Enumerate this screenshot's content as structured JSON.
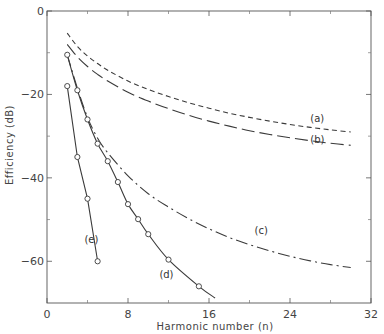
{
  "chart_data": {
    "type": "line",
    "title": "",
    "xlabel": "Harmonic number  (n)",
    "ylabel": "Efficiency (dB)",
    "xlim": [
      0,
      32
    ],
    "ylim": [
      -70,
      0
    ],
    "xticks": [
      0,
      8,
      16,
      24,
      32
    ],
    "xminor_ticks": [
      4,
      12,
      20,
      28
    ],
    "yticks": [
      0,
      -20,
      -40,
      -60
    ],
    "yminor_ticks": [
      -10,
      -30,
      -50
    ],
    "grid": false,
    "legend": "inline curve labels",
    "series": [
      {
        "name": "(a)",
        "style": "short-dash",
        "markers": false,
        "x": [
          2,
          3,
          4,
          5,
          6,
          8,
          10,
          12,
          14,
          16,
          18,
          20,
          22,
          24,
          26,
          28,
          30
        ],
        "y": [
          -5.3,
          -8.5,
          -10.8,
          -12.6,
          -14.2,
          -16.8,
          -18.8,
          -20.5,
          -22.0,
          -23.3,
          -24.5,
          -25.5,
          -26.4,
          -27.2,
          -27.9,
          -28.5,
          -29.0
        ],
        "label_pos": [
          26.0,
          -26.6
        ]
      },
      {
        "name": "(b)",
        "style": "long-dash",
        "markers": false,
        "x": [
          2,
          3,
          4,
          5,
          6,
          8,
          10,
          12,
          14,
          16,
          18,
          20,
          22,
          24,
          26,
          28,
          30
        ],
        "y": [
          -8.0,
          -11.0,
          -13.3,
          -15.2,
          -16.8,
          -19.5,
          -21.6,
          -23.4,
          -25.0,
          -26.4,
          -27.6,
          -28.7,
          -29.6,
          -30.4,
          -31.1,
          -31.7,
          -32.2
        ],
        "label_pos": [
          26.0,
          -31.6
        ]
      },
      {
        "name": "(c)",
        "style": "dash-dot",
        "markers": false,
        "x": [
          2,
          3,
          4,
          5,
          6,
          8,
          10,
          12,
          14,
          16,
          18,
          20,
          22,
          24,
          26,
          28,
          30
        ],
        "y": [
          -10.5,
          -18.5,
          -25.5,
          -30.5,
          -34.0,
          -39.5,
          -43.8,
          -47.0,
          -49.8,
          -52.2,
          -54.3,
          -56.0,
          -57.5,
          -58.8,
          -59.9,
          -60.8,
          -61.5
        ],
        "label_pos": [
          20.5,
          -53.5
        ]
      },
      {
        "name": "(d)",
        "style": "solid",
        "markers": true,
        "x": [
          2,
          3,
          4,
          5,
          6,
          7,
          8,
          9,
          10,
          12,
          15,
          16.6
        ],
        "y": [
          -10.5,
          -19.0,
          -26.0,
          -31.8,
          -36.0,
          -41.0,
          -46.3,
          -49.9,
          -53.5,
          -59.6,
          -66.0,
          -68.8
        ],
        "marker_x": [
          2,
          3,
          4,
          5,
          6,
          7,
          8,
          9,
          10,
          12,
          15
        ],
        "label_pos": [
          11.1,
          -64.0
        ]
      },
      {
        "name": "(e)",
        "style": "solid",
        "markers": true,
        "x": [
          2,
          3,
          4,
          5
        ],
        "y": [
          -18.0,
          -35.0,
          -45.0,
          -60.0
        ],
        "marker_x": [
          2,
          3,
          4,
          5
        ],
        "label_pos": [
          3.7,
          -55.5
        ]
      }
    ]
  }
}
